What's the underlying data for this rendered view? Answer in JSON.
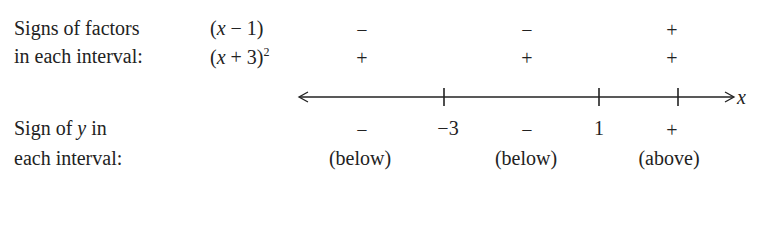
{
  "labels": {
    "factors_line1": "Signs of factors",
    "factors_line2": "in each interval:",
    "sign_y_line1": "Sign of y in",
    "sign_y_line2": "each interval:"
  },
  "factors": [
    {
      "expr_pre": "(",
      "var": "x",
      "expr_post": " − 1)",
      "sup": "",
      "signs": [
        "−",
        "−",
        "+"
      ]
    },
    {
      "expr_pre": "(",
      "var": "x",
      "expr_post": " + 3)",
      "sup": "2",
      "signs": [
        "+",
        "+",
        "+"
      ]
    }
  ],
  "axis": {
    "variable": "x",
    "ticks": [
      "−3",
      "1"
    ]
  },
  "result": {
    "signs": [
      "−",
      "−",
      "+"
    ],
    "descriptions": [
      "(below)",
      "(below)",
      "(above)"
    ]
  }
}
